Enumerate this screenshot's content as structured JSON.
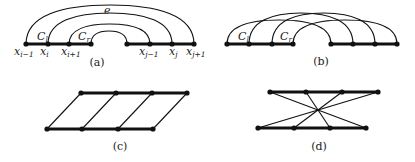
{
  "panels": {
    "a": {
      "caption": "(a)",
      "nodes_x": [
        26,
        48,
        69,
        91,
        127,
        150,
        172,
        194
      ],
      "baseline_y": 44,
      "thick_segments": [
        [
          26,
          91
        ],
        [
          127,
          194
        ]
      ],
      "arcs": [
        [
          26,
          194,
          5
        ],
        [
          48,
          172,
          13
        ],
        [
          69,
          150,
          24
        ],
        [
          91,
          127,
          31
        ]
      ],
      "labels": {
        "e": "e",
        "C_l": "C",
        "C_l_sub": "l",
        "C_r": "C",
        "C_r_sub": "r",
        "x_i_minus_1": "x",
        "x_i_minus_1_sub": "i−1",
        "x_i": "x",
        "x_i_sub": "i",
        "x_i_plus_1": "x",
        "x_i_plus_1_sub": "i+1",
        "x_j_minus_1": "x",
        "x_j_minus_1_sub": "j−1",
        "x_j": "x",
        "x_j_sub": "j",
        "x_j_plus_1": "x",
        "x_j_plus_1_sub": "j+1"
      }
    },
    "b": {
      "caption": "(b)",
      "nodes_x": [
        227,
        249,
        272,
        293,
        331,
        353,
        375,
        397
      ],
      "baseline_y": 44,
      "thick_segments": [
        [
          227,
          293
        ],
        [
          331,
          397
        ]
      ],
      "arcs": [
        [
          227,
          331,
          20
        ],
        [
          249,
          353,
          13
        ],
        [
          272,
          375,
          13
        ],
        [
          293,
          397,
          20
        ]
      ],
      "labels": {
        "C_l": "C",
        "C_l_sub": "l",
        "C_r": "C",
        "C_r_sub": "r"
      }
    },
    "c": {
      "caption": "(c)",
      "top_y": 93,
      "top_x": [
        81,
        116,
        152,
        187
      ],
      "bottom_y": 129,
      "bottom_x": [
        47,
        82,
        118,
        153
      ],
      "edges": [
        [
          0,
          0
        ],
        [
          1,
          1
        ],
        [
          2,
          2
        ],
        [
          3,
          3
        ]
      ]
    },
    "d": {
      "caption": "(d)",
      "top_y": 92,
      "top_x": [
        270,
        306,
        342,
        378
      ],
      "bottom_y": 128,
      "bottom_x": [
        258,
        294,
        330,
        366
      ],
      "edges": [
        [
          0,
          3
        ],
        [
          1,
          2
        ],
        [
          2,
          1
        ],
        [
          3,
          0
        ]
      ]
    }
  }
}
